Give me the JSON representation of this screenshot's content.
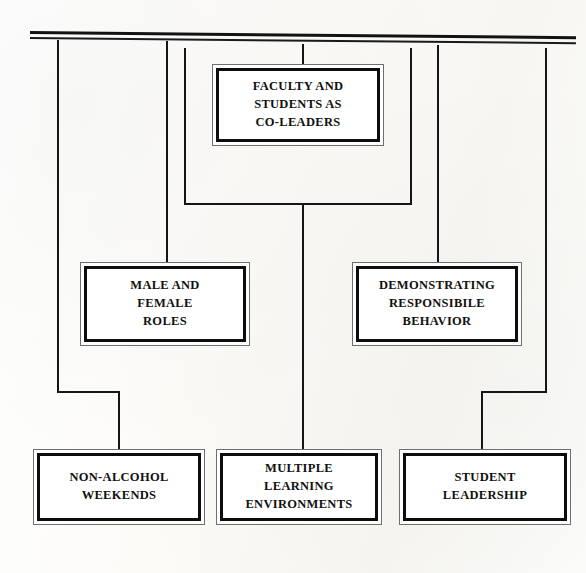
{
  "diagram": {
    "type": "flowchart",
    "orientation": "top-down",
    "background_color": "#fbfaf7",
    "line_color": "#161616",
    "box_border_color": "#0d0d0d",
    "box_fill_color": "#ffffff",
    "text_color": "#101010",
    "top_rule": {
      "name": "top-double-rule",
      "style": "double horizontal line",
      "drop_count": 6
    },
    "nodes": [
      {
        "id": "faculty",
        "label": "FACULTY AND\nSTUDENTS AS\nCO-LEADERS",
        "lines": [
          "FACULTY AND",
          "STUDENTS AS",
          "CO-LEADERS"
        ],
        "level": 1
      },
      {
        "id": "male-female",
        "label": "MALE AND\nFEMALE\nROLES",
        "lines": [
          "MALE AND",
          "FEMALE",
          "ROLES"
        ],
        "level": 2
      },
      {
        "id": "demonstrating",
        "label": "DEMONSTRATING\nRESPONSIBILE\nBEHAVIOR",
        "lines": [
          "DEMONSTRATING",
          "RESPONSIBILE",
          "BEHAVIOR"
        ],
        "level": 2
      },
      {
        "id": "non-alcohol",
        "label": "NON-ALCOHOL\nWEEKENDS",
        "lines": [
          "NON-ALCOHOL",
          "WEEKENDS"
        ],
        "level": 3
      },
      {
        "id": "multiple-learning",
        "label": "MULTIPLE\nLEARNING\nENVIRONMENTS",
        "lines": [
          "MULTIPLE",
          "LEARNING",
          "ENVIRONMENTS"
        ],
        "level": 3
      },
      {
        "id": "student-leadership",
        "label": "STUDENT\nLEADERSHIP",
        "lines": [
          "STUDENT",
          "LEADERSHIP"
        ],
        "level": 3
      }
    ],
    "connectors": [
      {
        "id": "drop-to-faculty",
        "from": "top-rule",
        "to": "faculty"
      },
      {
        "id": "drop-to-male-female",
        "from": "top-rule",
        "to": "male-female"
      },
      {
        "id": "drop-to-demonstrating",
        "from": "top-rule",
        "to": "demonstrating"
      },
      {
        "id": "drop-to-non-alcohol",
        "from": "top-rule",
        "to": "non-alcohol"
      },
      {
        "id": "drop-to-multiple",
        "from": "faculty",
        "to": "multiple-learning"
      },
      {
        "id": "drop-to-student",
        "from": "top-rule",
        "to": "student-leadership"
      }
    ]
  }
}
